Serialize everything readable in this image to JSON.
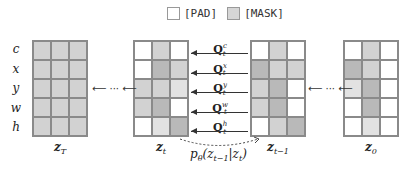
{
  "legend": [
    {
      "label": "[PAD]",
      "color": "#ffffff"
    },
    {
      "label": "[MASK]",
      "color": "#d6d6d6"
    }
  ],
  "row_labels": [
    "c",
    "x",
    "y",
    "w",
    "h"
  ],
  "grids": [
    {
      "label": "z",
      "sub": "T",
      "left": 32,
      "cells": [
        [
          2,
          2,
          2
        ],
        [
          2,
          2,
          2
        ],
        [
          2,
          2,
          2
        ],
        [
          2,
          2,
          2
        ],
        [
          2,
          2,
          2
        ]
      ]
    },
    {
      "label": "z",
      "sub": "t",
      "left": 133,
      "cells": [
        [
          0,
          2,
          0
        ],
        [
          0,
          3,
          2
        ],
        [
          2,
          2,
          1
        ],
        [
          2,
          3,
          0
        ],
        [
          0,
          1,
          3
        ]
      ]
    },
    {
      "label": "z",
      "sub": "t−1",
      "left": 250,
      "cells": [
        [
          0,
          2,
          0
        ],
        [
          3,
          2,
          2
        ],
        [
          2,
          3,
          0
        ],
        [
          2,
          3,
          0
        ],
        [
          0,
          2,
          3
        ]
      ]
    },
    {
      "label": "z",
      "sub": "0",
      "left": 343,
      "cells": [
        [
          0,
          2,
          0
        ],
        [
          3,
          2,
          0
        ],
        [
          1,
          3,
          0
        ],
        [
          0,
          3,
          0
        ],
        [
          0,
          1,
          0
        ]
      ]
    }
  ],
  "queries": [
    {
      "base": "Q",
      "sup": "c",
      "sub": "t"
    },
    {
      "base": "Q",
      "sup": "x",
      "sub": "t"
    },
    {
      "base": "Q",
      "sup": "y",
      "sub": "t"
    },
    {
      "base": "Q",
      "sup": "w",
      "sub": "t"
    },
    {
      "base": "Q",
      "sup": "h",
      "sub": "t"
    }
  ],
  "transition": {
    "text": "p",
    "sub": "θ",
    "args": "(z",
    "args_sub1": "t−1",
    "mid": "|z",
    "args_sub2": "t",
    "end": ")"
  },
  "step_arrow": "⟵ ··· ⟵"
}
